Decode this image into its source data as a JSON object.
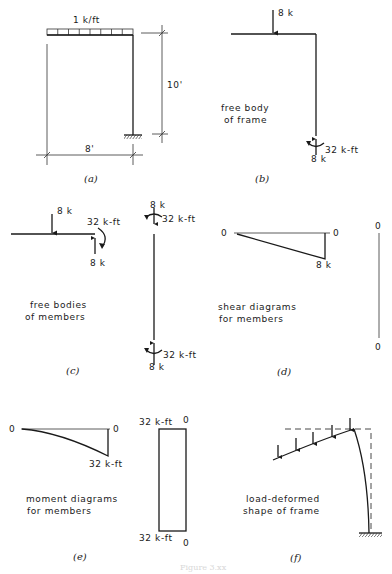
{
  "figure": {
    "caption_faint": "Figure 3.xx",
    "panels": {
      "a": {
        "caption": "(a)",
        "load_label": "1 k/ft",
        "height_dim": "10'",
        "span_dim": "8'"
      },
      "b": {
        "caption": "(b)",
        "title_line1": "free body",
        "title_line2": "of frame",
        "top_load": "8 k",
        "base_moment": "32 k-ft",
        "base_reaction": "8 k"
      },
      "c": {
        "caption": "(c)",
        "title_line1": "free bodies",
        "title_line2": "of members",
        "beam_load": "8 k",
        "beam_end_moment": "32 k-ft",
        "beam_end_shear": "8 k",
        "col_top_force": "8 k",
        "col_top_moment": "32 k-ft",
        "col_bottom_moment": "32 k-ft",
        "col_bottom_force": "8 k"
      },
      "d": {
        "caption": "(d)",
        "title_line1": "shear diagrams",
        "title_line2": "for members",
        "beam_left": "0",
        "beam_right": "0",
        "beam_max": "8 k",
        "col_top": "0",
        "col_bottom": "0"
      },
      "e": {
        "caption": "(e)",
        "title_line1": "moment diagrams",
        "title_line2": "for members",
        "beam_left": "0",
        "beam_right": "0",
        "beam_max": "32 k-ft",
        "col_top_value": "32 k-ft",
        "col_top_zero": "0",
        "col_bottom_value": "32 k-ft",
        "col_bottom_zero": "0"
      },
      "f": {
        "caption": "(f)",
        "title_line1": "load-deformed",
        "title_line2": "shape of frame"
      }
    }
  }
}
